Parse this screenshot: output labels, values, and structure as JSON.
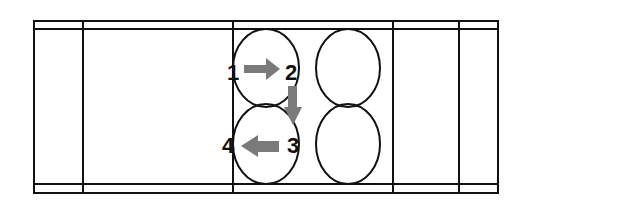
{
  "diagram": {
    "title": "",
    "cells": [
      {
        "id": 1,
        "label": "1"
      },
      {
        "id": 2,
        "label": "2"
      },
      {
        "id": 3,
        "label": "3"
      },
      {
        "id": 4,
        "label": "4"
      }
    ],
    "sequence": [
      "1",
      "2",
      "3",
      "4"
    ],
    "colors": {
      "line": "#111111",
      "arrow": "#7a7a7a",
      "background": "#ffffff"
    }
  }
}
